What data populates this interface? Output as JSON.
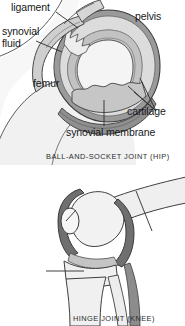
{
  "figure": {
    "background": "#ffffff",
    "width": 185,
    "height": 326
  },
  "panels": [
    {
      "id": "hip",
      "caption": "BALL-AND-SOCKET JOINT (HIP)",
      "labels": [
        {
          "id": "ligament",
          "text": "ligament"
        },
        {
          "id": "synovial_fluid",
          "line1": "synovial",
          "line2": "fluid"
        },
        {
          "id": "pelvis",
          "text": "pelvis"
        },
        {
          "id": "femur",
          "text": "femur"
        },
        {
          "id": "cartilage",
          "text": "cartilage"
        },
        {
          "id": "synovial_membrane",
          "text": "synovial membrane"
        }
      ]
    },
    {
      "id": "knee",
      "caption": "HINGE JOINT (KNEE)",
      "labels": [
        {
          "id": "patella",
          "line1": "patella",
          "line2": "(kneecap)"
        },
        {
          "id": "femur",
          "text": "femur"
        },
        {
          "id": "tibia",
          "text": "tibia"
        }
      ]
    }
  ],
  "colors": {
    "outline": "#3a3a3a",
    "bone_fill": "#efefef",
    "cartilage_fill": "#c9c9c9",
    "capsule_fill": "#b5b5b5",
    "capsule_dark": "#8a8a8a",
    "soft_tissue": "#f6f6f6",
    "label_text": "#16181a",
    "caption_text": "#2a2c2e",
    "leader_line": "#2b2b2b"
  }
}
